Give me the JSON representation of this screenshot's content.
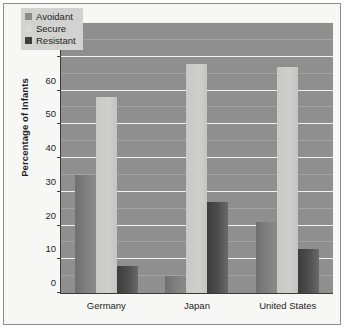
{
  "chart_data": {
    "type": "bar",
    "title": "",
    "xlabel": "",
    "ylabel": "Percentage of Infants",
    "ylim": [
      0,
      80
    ],
    "ytick_step": 10,
    "yticks": [
      0,
      10,
      20,
      30,
      40,
      50,
      60,
      70,
      80
    ],
    "minor_gridlines": [
      5,
      15,
      25,
      35,
      45,
      55,
      65,
      75
    ],
    "grid": true,
    "legend_position": "top-left",
    "categories": [
      "Germany",
      "Japan",
      "United States"
    ],
    "series": [
      {
        "name": "Avoidant",
        "color": "#8b8b8b",
        "values": [
          35,
          5,
          21
        ]
      },
      {
        "name": "Secure",
        "color": "#d7d7d5",
        "values": [
          58,
          68,
          67
        ]
      },
      {
        "name": "Resistant",
        "color": "#3f3f3f",
        "values": [
          8,
          27,
          13
        ]
      }
    ],
    "plot_background": "#8f8f8f",
    "gridline_color": "#f2f2f0"
  },
  "legend": {
    "items": [
      {
        "label": "Avoidant",
        "icon": "legend-swatch-avoidant"
      },
      {
        "label": "Secure",
        "icon": "legend-swatch-secure"
      },
      {
        "label": "Resistant",
        "icon": "legend-swatch-resistant"
      }
    ]
  }
}
